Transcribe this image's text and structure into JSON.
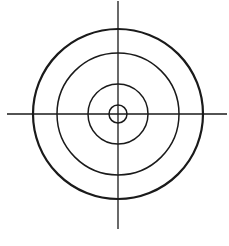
{
  "diagram": {
    "type": "crosshair-target",
    "stroke_color": "#1a1a1a",
    "background": "#ffffff",
    "center": {
      "x": 118,
      "y": 114
    },
    "circles": [
      {
        "name": "outer-ring",
        "r": 85,
        "stroke_width": 2.2
      },
      {
        "name": "second-ring",
        "r": 61,
        "stroke_width": 1.5
      },
      {
        "name": "third-ring",
        "r": 30,
        "stroke_width": 1.5
      },
      {
        "name": "center-ring",
        "r": 9,
        "stroke_width": 1.5
      }
    ],
    "crosshair": {
      "horizontal": {
        "x1": 7,
        "x2": 227,
        "y": 114
      },
      "vertical": {
        "y1": 1,
        "y2": 229,
        "x": 118
      },
      "stroke_width": 1.3
    }
  }
}
